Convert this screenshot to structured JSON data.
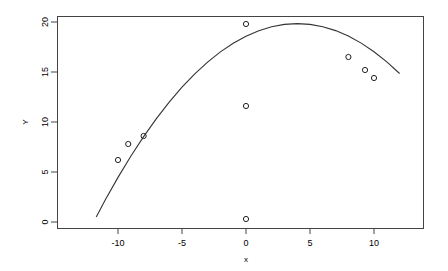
{
  "chart_data": {
    "type": "scatter",
    "title": "",
    "subtitle": "",
    "xlabel": "x",
    "ylabel": "Y",
    "xlim": [
      -11.7,
      12.0
    ],
    "ylim": [
      -0.6,
      20.8
    ],
    "grid": false,
    "legend": null,
    "x_ticks": [
      -10,
      -5,
      0,
      5,
      10
    ],
    "x_tick_labels": [
      "-10",
      "-5",
      "0",
      "5",
      "10"
    ],
    "y_ticks": [
      0,
      5,
      10,
      15,
      20
    ],
    "y_tick_labels": [
      "0",
      "5",
      "10",
      "15",
      "20"
    ],
    "marker": "open-circle",
    "points": [
      {
        "x": -10.0,
        "y": 6.2
      },
      {
        "x": -9.2,
        "y": 7.8
      },
      {
        "x": -8.0,
        "y": 8.6
      },
      {
        "x": 0.0,
        "y": 19.8
      },
      {
        "x": 0.0,
        "y": 11.6
      },
      {
        "x": 0.0,
        "y": 0.3
      },
      {
        "x": 8.0,
        "y": 16.5
      },
      {
        "x": 9.3,
        "y": 15.2
      },
      {
        "x": 10.0,
        "y": 14.4
      }
    ],
    "series": [
      {
        "name": "fitted quadratic",
        "type": "line",
        "vertex": {
          "x": 2.0,
          "y": 20.2
        },
        "curve_points": [
          {
            "x": -11.7,
            "y": 0.5
          },
          {
            "x": -11.0,
            "y": 2.19
          },
          {
            "x": -10.0,
            "y": 4.46
          },
          {
            "x": -9.0,
            "y": 6.58
          },
          {
            "x": -8.0,
            "y": 8.54
          },
          {
            "x": -7.0,
            "y": 10.34
          },
          {
            "x": -6.0,
            "y": 11.99
          },
          {
            "x": -5.0,
            "y": 13.48
          },
          {
            "x": -4.0,
            "y": 14.81
          },
          {
            "x": -3.0,
            "y": 15.99
          },
          {
            "x": -2.0,
            "y": 17.01
          },
          {
            "x": -1.0,
            "y": 17.87
          },
          {
            "x": 0.0,
            "y": 18.58
          },
          {
            "x": 1.0,
            "y": 19.13
          },
          {
            "x": 2.0,
            "y": 19.52
          },
          {
            "x": 3.0,
            "y": 19.76
          },
          {
            "x": 4.0,
            "y": 19.84
          },
          {
            "x": 5.0,
            "y": 19.76
          },
          {
            "x": 6.0,
            "y": 19.53
          },
          {
            "x": 7.0,
            "y": 19.14
          },
          {
            "x": 8.0,
            "y": 18.59
          },
          {
            "x": 9.0,
            "y": 17.89
          },
          {
            "x": 10.0,
            "y": 17.03
          },
          {
            "x": 11.0,
            "y": 16.02
          },
          {
            "x": 12.0,
            "y": 14.85
          }
        ]
      }
    ]
  },
  "axes": {
    "y_label_text": "Y",
    "x_label_text": "x"
  }
}
